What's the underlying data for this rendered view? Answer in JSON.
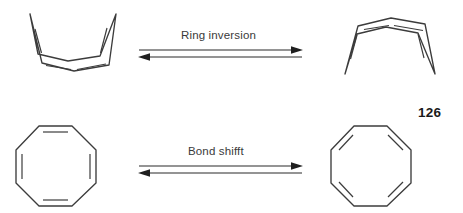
{
  "figure": {
    "compound_number": "126",
    "background_color": "#ffffff",
    "stroke_color": "#3c3c3c",
    "text_color": "#3a3a3a"
  },
  "reactions": [
    {
      "id": "ring-inversion",
      "label": "Ring inversion",
      "arrow_type": "equilibrium",
      "left_structure": "tub-shaped cyclooctatetraene, wings up",
      "right_structure": "tub-shaped cyclooctatetraene, wings down"
    },
    {
      "id": "bond-shift",
      "label": "Bond shifft",
      "arrow_type": "equilibrium",
      "left_structure": "planar octagon, double bonds on axis-aligned edges",
      "right_structure": "planar octagon, double bonds on diagonal edges"
    }
  ],
  "structures": {
    "tub_up": {
      "name": "cyclooctatetraene-tub-up",
      "outline": "18,6 30,55 62,63 97,57 104,6 88,48 56,53 26,46",
      "double_bonds": [
        "23,20 30,46",
        "95,19 88,46",
        "33,58 60,62",
        "64,62 95,57"
      ]
    },
    "tub_down": {
      "name": "cyclooctatetraene-tub-down",
      "outline": "20,62 33,16 66,8 98,14 108,62 91,22 60,17 31,24",
      "double_bonds": [
        "25,48 32,24",
        "97,47 91,23",
        "38,19 64,15",
        "68,15 96,20"
      ]
    },
    "octagon_axis": {
      "name": "planar-cot-axis-double-bonds",
      "vertices": "25,0 58,0 82,24 82,57 58,80 25,80 2,57 2,24",
      "inner_bonds": [
        "29,6 54,6",
        "29,74 54,74",
        "8,28 8,53",
        "76,28 76,53"
      ]
    },
    "octagon_diagonal": {
      "name": "planar-cot-diagonal-double-bonds",
      "vertices": "25,0 58,0 82,24 82,57 58,80 25,80 2,57 2,24",
      "inner_bonds": [
        "24,9 9,24",
        "59,9 74,24",
        "74,56 59,71",
        "9,56 24,71"
      ]
    }
  },
  "arrows": {
    "forward": {
      "direction": "right",
      "length": 162
    },
    "reverse": {
      "direction": "left",
      "length": 162
    }
  }
}
